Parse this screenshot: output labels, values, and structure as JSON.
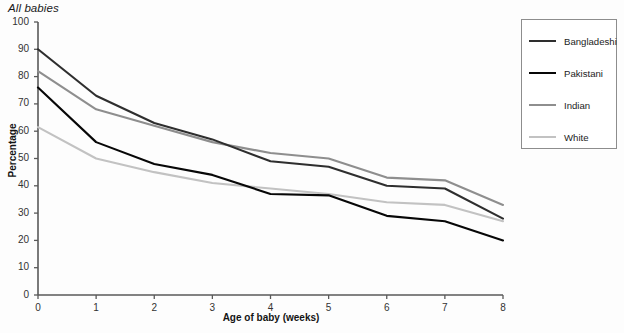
{
  "chart_data": {
    "type": "line",
    "title": "All babies",
    "xlabel": "Age of baby (weeks)",
    "ylabel": "Percentage",
    "x": [
      0,
      1,
      2,
      3,
      4,
      5,
      6,
      7,
      8
    ],
    "xlim": [
      0,
      8
    ],
    "ylim": [
      0,
      100
    ],
    "xticks": [
      "0",
      "1",
      "2",
      "3",
      "4",
      "5",
      "6",
      "7",
      "8"
    ],
    "yticks": [
      "0",
      "10",
      "20",
      "30",
      "40",
      "50",
      "60",
      "70",
      "80",
      "90",
      "100"
    ],
    "grid": false,
    "legend_position": "right-outside",
    "series": [
      {
        "name": "Bangladeshi",
        "color": "#2e2e2e",
        "values": [
          90,
          73,
          63,
          57,
          49,
          47,
          40,
          39,
          28
        ]
      },
      {
        "name": "Pakistani",
        "color": "#070707",
        "values": [
          76,
          56,
          48,
          44,
          37,
          36.5,
          29,
          27,
          20
        ]
      },
      {
        "name": "Indian",
        "color": "#8e8e8e",
        "values": [
          82,
          68,
          62,
          56,
          52,
          50,
          43,
          42,
          33
        ]
      },
      {
        "name": "White",
        "color": "#c2c2c2",
        "values": [
          61.5,
          50,
          45,
          41,
          39,
          37,
          34,
          33,
          27
        ]
      }
    ]
  },
  "axes": {
    "axis_color": "#595959",
    "background": "#fdfdfd"
  }
}
